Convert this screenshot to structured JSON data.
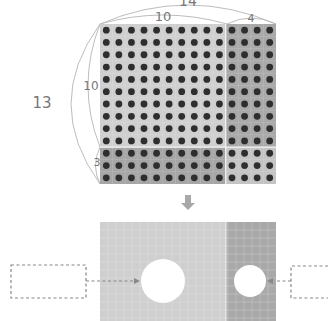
{
  "grid": {
    "total_columns": 14,
    "total_rows": 13,
    "split_column": 10,
    "split_row": 10,
    "regions": [
      {
        "name": "top-left",
        "columns": 10,
        "rows": 10,
        "color": "#cfcfcf"
      },
      {
        "name": "top-right",
        "columns": 4,
        "rows": 10,
        "color": "#a9a9a9"
      },
      {
        "name": "bottom-left",
        "columns": 10,
        "rows": 3,
        "color": "#a6a6a6"
      },
      {
        "name": "bottom-right",
        "columns": 4,
        "rows": 3,
        "color": "#c4c4c4"
      }
    ],
    "dot_color": "#2e2e2e"
  },
  "labels": {
    "total_width": "14",
    "left_width": "10",
    "right_width": "4",
    "total_height": "13",
    "top_height": "10",
    "bottom_height": "3"
  },
  "arrow": {
    "icon": "down-arrow-icon",
    "color": "#a8a8a8"
  },
  "bottom_panel": {
    "left_color": "#cfcfcf",
    "right_color": "#a9a9a9",
    "left_answer_box": "",
    "right_answer_box": "",
    "dashed_color": "#888888"
  }
}
